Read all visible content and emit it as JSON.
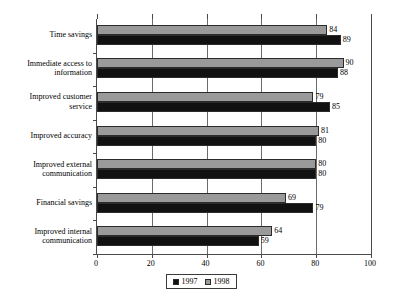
{
  "chart_data": {
    "type": "bar",
    "orientation": "horizontal",
    "title": "",
    "subtitle": "",
    "xlabel": "",
    "ylabel": "",
    "xlim": [
      0,
      100
    ],
    "xticks": [
      0,
      20,
      40,
      60,
      80,
      100
    ],
    "grid": true,
    "grid_axis": "x",
    "legend_position": "bottom-center",
    "categories": [
      "Time savings",
      "Immediate access to information",
      "Improved customer service",
      "Improved accuracy",
      "Improved external communication",
      "Financial savings",
      "Improved internal communication"
    ],
    "category_label_lines": [
      [
        "Time savings"
      ],
      [
        "Immediate access to",
        "information"
      ],
      [
        "Improved customer",
        "service"
      ],
      [
        "Improved accuracy"
      ],
      [
        "Improved external",
        "communication"
      ],
      [
        "Financial savings"
      ],
      [
        "Improved internal",
        "communication"
      ]
    ],
    "series": [
      {
        "name": "1997",
        "color": "#111111",
        "values": [
          89,
          88,
          85,
          80,
          80,
          79,
          59
        ]
      },
      {
        "name": "1998",
        "color": "#9a9a9a",
        "values": [
          84,
          90,
          79,
          81,
          80,
          69,
          64
        ]
      }
    ],
    "data_labels_shown": true
  },
  "legend": {
    "entries": [
      {
        "label": "1997",
        "swatch": "black-square-swatch"
      },
      {
        "label": "1998",
        "swatch": "gray-square-swatch"
      }
    ]
  },
  "colors": {
    "series_1997": "#111111",
    "series_1998": "#9a9a9a",
    "axis": "#4a4a4a",
    "gridline": "#6b6b6b",
    "background": "#ffffff",
    "text": "#000000"
  }
}
